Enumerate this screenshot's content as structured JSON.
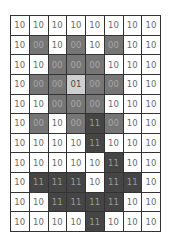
{
  "grid": {
    "columns": 8,
    "rows": 11,
    "cells": [
      [
        "10",
        "10",
        "10",
        "10",
        "10",
        "10",
        "10",
        "10"
      ],
      [
        "10",
        "00",
        "10",
        "00",
        "10",
        "00",
        "10",
        "10"
      ],
      [
        "10",
        "10",
        "00",
        "00",
        "00",
        "10",
        "10",
        "10"
      ],
      [
        "10",
        "00",
        "00",
        "01",
        "00",
        "00",
        "10",
        "10"
      ],
      [
        "10",
        "10",
        "00",
        "00",
        "00",
        "10",
        "10",
        "10"
      ],
      [
        "10",
        "00",
        "10",
        "00",
        "11",
        "00",
        "10",
        "10"
      ],
      [
        "10",
        "10",
        "10",
        "10",
        "11",
        "10",
        "10",
        "10"
      ],
      [
        "10",
        "10",
        "10",
        "10",
        "10",
        "11",
        "10",
        "10"
      ],
      [
        "10",
        "11",
        "11",
        "11",
        "10",
        "11",
        "11",
        "10"
      ],
      [
        "10",
        "10",
        "11",
        "11",
        "11",
        "11",
        "10",
        "10"
      ],
      [
        "10",
        "10",
        "10",
        "10",
        "11",
        "10",
        "10",
        "10"
      ]
    ],
    "legend_colors": {
      "10": "#ffffff",
      "00": "#767676",
      "01": "#cfcfcf",
      "11": "#454545"
    }
  }
}
